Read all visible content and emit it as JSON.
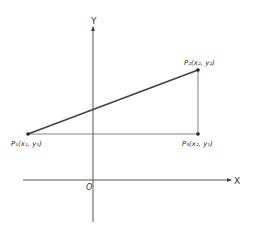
{
  "diagram": {
    "axes": {
      "x_label": "X",
      "y_label": "Y",
      "origin_label": "O"
    },
    "points": [
      {
        "id": "P1",
        "base": "P",
        "sub": "1",
        "coords": "(x₁, y₁)",
        "x": 28,
        "y": 134
      },
      {
        "id": "P2",
        "base": "P",
        "sub": "2",
        "coords": "(x₂, y₂)",
        "x": 198,
        "y": 70
      },
      {
        "id": "P3",
        "base": "P",
        "sub": "3",
        "coords": "(x₂, y₁)",
        "x": 198,
        "y": 134
      }
    ],
    "labels": {
      "p1": "P₁(x₁, y₁)",
      "p2": "P₂(x₂, y₂)",
      "p3": "P₃(x₂, y₁)"
    },
    "colors": {
      "line": "#444444",
      "axis": "#555555",
      "text": "#333333"
    }
  }
}
